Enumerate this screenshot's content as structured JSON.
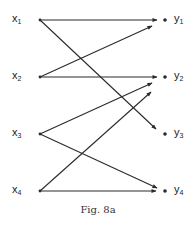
{
  "figure": {
    "caption": "Fig. 8a",
    "left_nodes": [
      {
        "id": "x1",
        "base": "x",
        "sub": "1",
        "x": 40,
        "y": 20
      },
      {
        "id": "x2",
        "base": "x",
        "sub": "2",
        "x": 40,
        "y": 77
      },
      {
        "id": "x3",
        "base": "x",
        "sub": "3",
        "x": 40,
        "y": 134
      },
      {
        "id": "x4",
        "base": "x",
        "sub": "4",
        "x": 40,
        "y": 191
      }
    ],
    "right_nodes": [
      {
        "id": "y1",
        "base": "y",
        "sub": "1",
        "x": 165,
        "y": 20
      },
      {
        "id": "y2",
        "base": "y",
        "sub": "2",
        "x": 165,
        "y": 77
      },
      {
        "id": "y3",
        "base": "y",
        "sub": "3",
        "x": 165,
        "y": 134
      },
      {
        "id": "y4",
        "base": "y",
        "sub": "4",
        "x": 165,
        "y": 191
      }
    ],
    "edges": [
      {
        "from": "x1",
        "to": "y1",
        "x1": 40,
        "y1": 20,
        "x2": 157,
        "y2": 20
      },
      {
        "from": "x1",
        "to": "y3",
        "x1": 40,
        "y1": 20,
        "x2": 156,
        "y2": 129
      },
      {
        "from": "x2",
        "to": "y1",
        "x1": 40,
        "y1": 77,
        "x2": 152,
        "y2": 26
      },
      {
        "from": "x2",
        "to": "y2",
        "x1": 40,
        "y1": 77,
        "x2": 157,
        "y2": 77
      },
      {
        "from": "x3",
        "to": "y2",
        "x1": 40,
        "y1": 134,
        "x2": 152,
        "y2": 83
      },
      {
        "from": "x3",
        "to": "y4",
        "x1": 40,
        "y1": 134,
        "x2": 157,
        "y2": 188
      },
      {
        "from": "x4",
        "to": "y2",
        "x1": 40,
        "y1": 191,
        "x2": 151,
        "y2": 92
      },
      {
        "from": "x4",
        "to": "y4",
        "x1": 40,
        "y1": 191,
        "x2": 156,
        "y2": 191
      }
    ],
    "colors": {
      "line": "#2a2a2a",
      "text": "#222222",
      "background": "#ffffff"
    }
  }
}
